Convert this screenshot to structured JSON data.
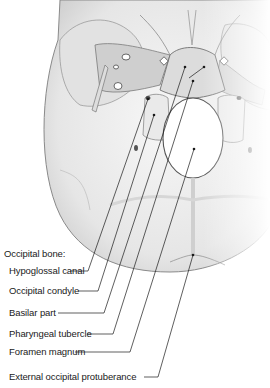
{
  "figure": {
    "heading": "Occipital bone:",
    "colors": {
      "bone_light": "#f2f2f2",
      "bone_mid": "#d6d6d6",
      "bone_dark": "#9a9a9a",
      "outline": "#555555",
      "line": "#1a1a1a",
      "background": "#ffffff"
    },
    "labels": [
      {
        "id": "hypoglossal-canal",
        "text": "Hypoglossal canal",
        "x": 9,
        "y": 265,
        "line": [
          [
            70,
            271
          ],
          [
            88,
            271
          ],
          [
            148,
            99
          ]
        ]
      },
      {
        "id": "occipital-condyle",
        "text": "Occipital condyle",
        "x": 9,
        "y": 285,
        "line": [
          [
            78,
            291
          ],
          [
            98,
            291
          ],
          [
            154,
            115
          ]
        ]
      },
      {
        "id": "basilar-part",
        "text": "Basilar part",
        "x": 9,
        "y": 307,
        "line": [
          [
            58,
            313
          ],
          [
            104,
            313
          ],
          [
            185,
            67
          ]
        ]
      },
      {
        "id": "pharyngeal-tubercle",
        "text": "Pharyngeal tubercle",
        "x": 9,
        "y": 328,
        "line": [
          [
            87,
            334
          ],
          [
            113,
            334
          ],
          [
            193,
            81
          ]
        ]
      },
      {
        "id": "foramen-magnum",
        "text": "Foramen magnum",
        "x": 9,
        "y": 346,
        "line": [
          [
            75,
            352
          ],
          [
            130,
            352
          ],
          [
            194,
            149
          ]
        ]
      },
      {
        "id": "external-occipital-protuberance",
        "text": "External occipital protuberance",
        "x": 9,
        "y": 371,
        "line": [
          [
            144,
            377
          ],
          [
            158,
            377
          ],
          [
            193,
            255
          ]
        ]
      }
    ],
    "extra_dots": [
      [
        204,
        67
      ]
    ]
  }
}
